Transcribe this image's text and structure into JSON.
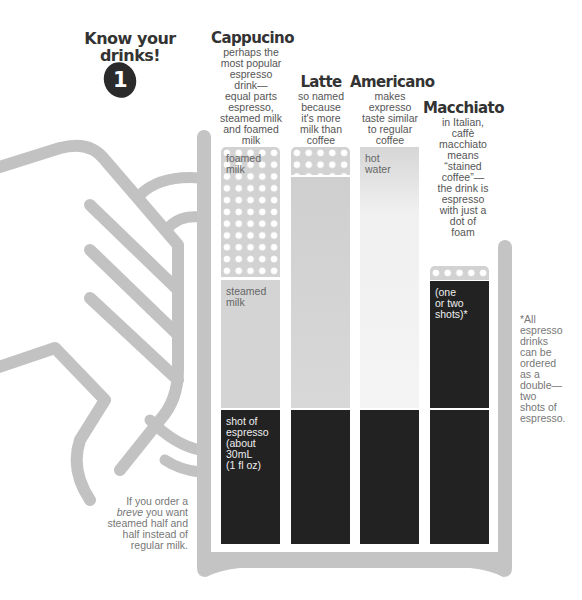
{
  "header": {
    "title_line1": "Know your",
    "title_line2": "drinks!",
    "badge_number": "1"
  },
  "drinks": [
    {
      "name": "Cappucino",
      "description": [
        "perhaps the",
        "most popular",
        "espresso",
        "drink—",
        "equal parts",
        "espresso,",
        "steamed milk",
        "and foamed",
        "milk"
      ],
      "layers": [
        {
          "type": "foam",
          "label_line1": "foamed",
          "label_line2": "milk"
        },
        {
          "type": "steamed-milk",
          "label_line1": "steamed",
          "label_line2": "milk"
        },
        {
          "type": "espresso",
          "label": [
            "shot of",
            "espresso",
            "(about",
            "30mL",
            "(1 fl oz)"
          ]
        }
      ]
    },
    {
      "name": "Latte",
      "description": [
        "so named",
        "because",
        "it's more",
        "milk than",
        "coffee"
      ],
      "layers": [
        {
          "type": "foam"
        },
        {
          "type": "steamed-milk"
        },
        {
          "type": "espresso"
        }
      ]
    },
    {
      "name": "Americano",
      "description": [
        "makes",
        "expresso",
        "taste similar",
        "to regular",
        "coffee"
      ],
      "layers": [
        {
          "type": "hot-water",
          "label_line1": "hot",
          "label_line2": "water"
        },
        {
          "type": "espresso"
        }
      ]
    },
    {
      "name": "Macchiato",
      "description": [
        "in Italian,",
        "caffè",
        "macchiato",
        "means",
        "“stained",
        "coffee”—",
        "the drink is",
        "espresso",
        "with just a",
        "dot of",
        "foam"
      ],
      "layers": [
        {
          "type": "foam"
        },
        {
          "type": "espresso",
          "label": [
            "(one",
            "or two",
            "shots)*"
          ]
        },
        {
          "type": "espresso"
        }
      ]
    }
  ],
  "notes": {
    "double_shot": [
      "*All",
      "espresso",
      "drinks",
      "can be",
      "ordered",
      "as a",
      "double—",
      "two",
      "shots of",
      "espresso."
    ],
    "breve_line1": "If you order a",
    "breve_italic": "breve",
    "breve_line2_rest": " you want",
    "breve_line3": "steamed half and",
    "breve_line4": "half instead of",
    "breve_line5": "regular milk."
  },
  "colors": {
    "espresso": "#222222",
    "steamed_milk": "#d4d4d4",
    "foam": "#d2d2d2",
    "hot_water": "#f1f1f1",
    "cup_outline": "#c4c4c4",
    "title": "#333333"
  }
}
